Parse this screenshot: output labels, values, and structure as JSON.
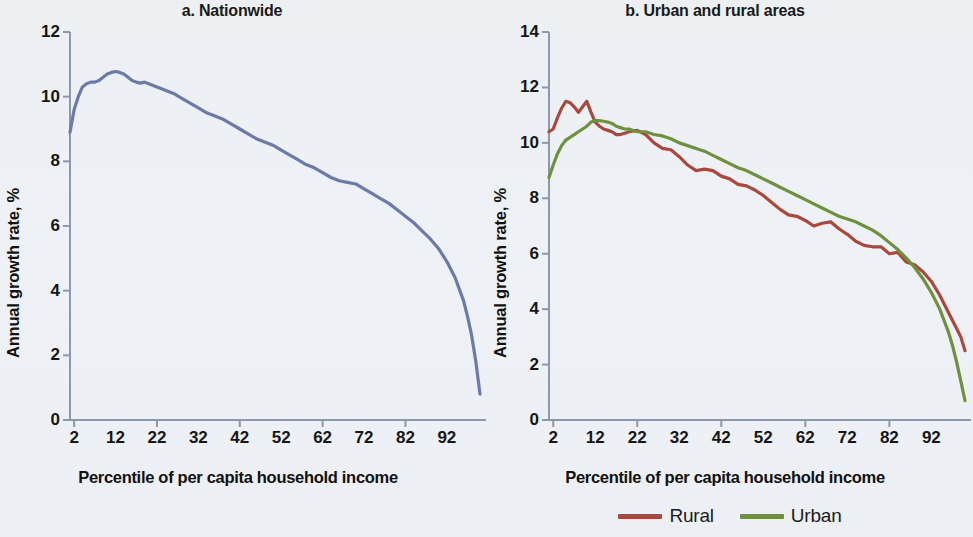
{
  "figure": {
    "background": "#eef1f4",
    "panels": [
      {
        "id": "a",
        "title": "a. Nationwide",
        "xlabel": "Percentile of per capita household income",
        "ylabel": "Annual growth rate, %"
      },
      {
        "id": "b",
        "title": "b. Urban and rural areas",
        "xlabel": "Percentile of per capita household income",
        "ylabel": "Annual growth rate, %"
      }
    ]
  },
  "legend": {
    "position": "bottom-center-under-panel-b",
    "items": [
      {
        "label": "Rural",
        "color": "#a9483c"
      },
      {
        "label": "Urban",
        "color": "#6e9140"
      }
    ]
  },
  "chart_data": [
    {
      "type": "line",
      "id": "a",
      "title": "a. Nationwide",
      "xlabel": "Percentile of per capita household income",
      "ylabel": "Annual growth rate, %",
      "xlim": [
        1,
        100
      ],
      "ylim": [
        0,
        12
      ],
      "yticks": [
        0,
        2,
        4,
        6,
        8,
        10,
        12
      ],
      "xticks": [
        2,
        12,
        22,
        32,
        42,
        52,
        62,
        72,
        82,
        92
      ],
      "grid": false,
      "legend": false,
      "series": [
        {
          "name": "Nationwide",
          "color": "#6a7ba8",
          "x": [
            1,
            2,
            3,
            4,
            5,
            6,
            7,
            8,
            9,
            10,
            11,
            12,
            13,
            14,
            15,
            16,
            17,
            18,
            19,
            20,
            22,
            24,
            26,
            28,
            30,
            32,
            34,
            36,
            38,
            40,
            42,
            44,
            46,
            48,
            50,
            52,
            54,
            56,
            58,
            60,
            62,
            64,
            66,
            68,
            70,
            72,
            74,
            76,
            78,
            80,
            82,
            84,
            86,
            88,
            90,
            92,
            94,
            96,
            97,
            98,
            99,
            100
          ],
          "values": [
            8.9,
            9.6,
            10.0,
            10.3,
            10.4,
            10.45,
            10.45,
            10.5,
            10.6,
            10.7,
            10.75,
            10.78,
            10.75,
            10.7,
            10.6,
            10.5,
            10.45,
            10.42,
            10.45,
            10.4,
            10.3,
            10.2,
            10.1,
            9.95,
            9.8,
            9.65,
            9.5,
            9.4,
            9.3,
            9.15,
            9.0,
            8.85,
            8.7,
            8.6,
            8.5,
            8.35,
            8.2,
            8.05,
            7.9,
            7.8,
            7.65,
            7.5,
            7.4,
            7.35,
            7.3,
            7.15,
            7.0,
            6.85,
            6.7,
            6.5,
            6.3,
            6.1,
            5.85,
            5.6,
            5.3,
            4.9,
            4.4,
            3.7,
            3.2,
            2.6,
            1.8,
            0.8
          ]
        }
      ]
    },
    {
      "type": "line",
      "id": "b",
      "title": "b. Urban and rural areas",
      "xlabel": "Percentile of per capita household income",
      "ylabel": "Annual growth rate, %",
      "xlim": [
        1,
        100
      ],
      "ylim": [
        0,
        14
      ],
      "yticks": [
        0,
        2,
        4,
        6,
        8,
        10,
        12,
        14
      ],
      "xticks": [
        2,
        12,
        22,
        32,
        42,
        52,
        62,
        72,
        82,
        92
      ],
      "grid": false,
      "legend": true,
      "series": [
        {
          "name": "Rural",
          "color": "#a9483c",
          "x": [
            1,
            2,
            3,
            4,
            5,
            6,
            7,
            8,
            9,
            10,
            11,
            12,
            13,
            14,
            15,
            16,
            17,
            18,
            19,
            20,
            22,
            24,
            26,
            28,
            30,
            32,
            34,
            36,
            38,
            40,
            42,
            44,
            46,
            48,
            50,
            52,
            54,
            56,
            58,
            60,
            62,
            64,
            66,
            68,
            70,
            72,
            74,
            76,
            78,
            80,
            82,
            84,
            86,
            88,
            90,
            92,
            94,
            96,
            97,
            98,
            99,
            100
          ],
          "values": [
            10.4,
            10.5,
            10.9,
            11.25,
            11.5,
            11.45,
            11.3,
            11.1,
            11.3,
            11.5,
            11.1,
            10.75,
            10.6,
            10.5,
            10.45,
            10.4,
            10.3,
            10.3,
            10.35,
            10.4,
            10.45,
            10.3,
            10.0,
            9.8,
            9.75,
            9.5,
            9.2,
            9.0,
            9.05,
            9.0,
            8.8,
            8.7,
            8.5,
            8.45,
            8.3,
            8.1,
            7.85,
            7.6,
            7.4,
            7.35,
            7.2,
            7.0,
            7.1,
            7.15,
            6.9,
            6.7,
            6.45,
            6.3,
            6.25,
            6.25,
            6.0,
            6.05,
            5.7,
            5.6,
            5.35,
            5.0,
            4.5,
            3.9,
            3.6,
            3.3,
            3.0,
            2.5
          ]
        },
        {
          "name": "Urban",
          "color": "#6e9140",
          "x": [
            1,
            2,
            3,
            4,
            5,
            6,
            7,
            8,
            9,
            10,
            11,
            12,
            13,
            14,
            15,
            16,
            17,
            18,
            19,
            20,
            22,
            24,
            26,
            28,
            30,
            32,
            34,
            36,
            38,
            40,
            42,
            44,
            46,
            48,
            50,
            52,
            54,
            56,
            58,
            60,
            62,
            64,
            66,
            68,
            70,
            72,
            74,
            76,
            78,
            80,
            82,
            84,
            86,
            88,
            90,
            92,
            94,
            96,
            97,
            98,
            99,
            100
          ],
          "values": [
            8.75,
            9.2,
            9.6,
            9.9,
            10.1,
            10.2,
            10.3,
            10.4,
            10.5,
            10.6,
            10.75,
            10.8,
            10.8,
            10.78,
            10.75,
            10.7,
            10.6,
            10.55,
            10.5,
            10.5,
            10.4,
            10.4,
            10.3,
            10.25,
            10.15,
            10.0,
            9.9,
            9.8,
            9.7,
            9.55,
            9.4,
            9.25,
            9.1,
            9.0,
            8.85,
            8.7,
            8.55,
            8.4,
            8.25,
            8.1,
            7.95,
            7.8,
            7.65,
            7.5,
            7.35,
            7.25,
            7.15,
            7.0,
            6.85,
            6.65,
            6.4,
            6.15,
            5.85,
            5.5,
            5.1,
            4.6,
            4.0,
            3.2,
            2.7,
            2.1,
            1.4,
            0.7
          ]
        }
      ]
    }
  ]
}
